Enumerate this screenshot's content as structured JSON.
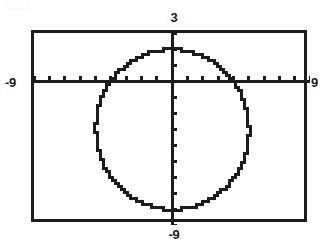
{
  "figure": {
    "kind": "graphing-calculator-plot",
    "background_color": "#ffffff",
    "ink_color": "#1c1c1c",
    "frame": {
      "x": 31,
      "y": 30,
      "width": 276,
      "height": 192,
      "border_width": 3
    }
  },
  "labels": {
    "top": "3",
    "bottom": "-9",
    "left": "-9",
    "right": "9"
  },
  "chart_data": {
    "type": "scatter",
    "title": "",
    "subtitle": "",
    "xlabel": "",
    "ylabel": "",
    "xlim": [
      -9,
      9
    ],
    "ylim": [
      -9,
      3
    ],
    "grid": false,
    "legend": null,
    "axes": {
      "x_axis_label_left": "-9",
      "x_axis_label_right": "9",
      "y_axis_label_top": "3",
      "y_axis_label_bottom": "-9",
      "x_tick_interval": 1,
      "y_tick_interval": 1,
      "x_ticks": [
        -9,
        -8,
        -7,
        -6,
        -5,
        -4,
        -3,
        -2,
        -1,
        0,
        1,
        2,
        3,
        4,
        5,
        6,
        7,
        8,
        9
      ],
      "y_ticks": [
        -9,
        -8,
        -7,
        -6,
        -5,
        -4,
        -3,
        -2,
        -1,
        0,
        1,
        2,
        3
      ],
      "x_axis_y_value": 0,
      "y_axis_x_value": 0,
      "axis_line_width": 3,
      "tick_length": 5
    },
    "annotations": [],
    "series": [
      {
        "name": "circle",
        "type": "implicit-curve",
        "equation": "x^2 + (y + 3)^2 = 25",
        "center": [
          0,
          -3
        ],
        "radius": 5,
        "render": "pixelated-stairstep",
        "stroke_width": 3,
        "stroke_color": "#1c1c1c",
        "extremes": {
          "top": [
            0,
            2
          ],
          "bottom": [
            0,
            -8
          ],
          "left": [
            -5,
            -3
          ],
          "right": [
            5,
            -3
          ]
        }
      }
    ]
  }
}
